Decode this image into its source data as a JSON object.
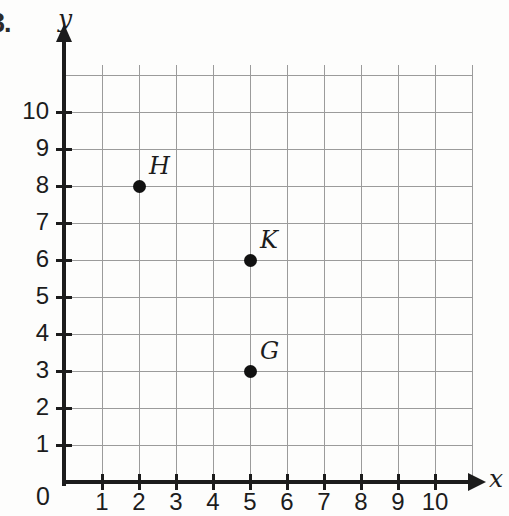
{
  "problem_number": "3.",
  "chart_data": {
    "type": "scatter",
    "title": "",
    "xlabel": "x",
    "ylabel": "y",
    "xlim": [
      0,
      11
    ],
    "ylim": [
      0,
      11
    ],
    "grid": true,
    "legend": "none",
    "x_ticks": [
      "1",
      "2",
      "3",
      "4",
      "5",
      "6",
      "7",
      "8",
      "9",
      "10"
    ],
    "y_ticks": [
      "1",
      "2",
      "3",
      "4",
      "5",
      "6",
      "7",
      "8",
      "9",
      "10"
    ],
    "origin_label": "0",
    "x_tick_values": [
      1,
      2,
      3,
      4,
      5,
      6,
      7,
      8,
      9,
      10
    ],
    "y_tick_values": [
      1,
      2,
      3,
      4,
      5,
      6,
      7,
      8,
      9,
      10
    ],
    "points": [
      {
        "label": "H",
        "x": 2,
        "y": 8
      },
      {
        "label": "K",
        "x": 5,
        "y": 6
      },
      {
        "label": "G",
        "x": 5,
        "y": 3
      }
    ],
    "colors": {
      "point": "#111111",
      "grid": "#9b9b9b",
      "axis": "#1c1c1c",
      "background": "#fdfdfc"
    }
  }
}
